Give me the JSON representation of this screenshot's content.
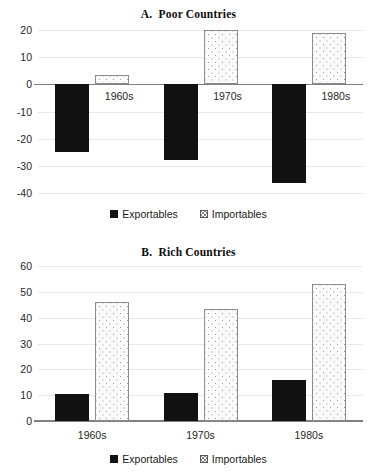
{
  "figure": {
    "panels": [
      "A",
      "B"
    ]
  },
  "legend": {
    "exportables_label": "Exportables",
    "importables_label": "Importables",
    "exportables_swatch": "filled-square-icon",
    "importables_swatch": "dotted-square-icon",
    "exportables_color": "#111111",
    "importables_color": "#fbfbfb"
  },
  "panel_a": {
    "title": "A.  Poor Countries",
    "y_ticks": [
      "20",
      "10",
      "0",
      "-10",
      "-20",
      "-30",
      "-40"
    ],
    "categories": [
      "1960s",
      "1970s",
      "1980s"
    ]
  },
  "panel_b": {
    "title": "B.  Rich Countries",
    "y_ticks": [
      "60",
      "50",
      "40",
      "30",
      "20",
      "10",
      "0"
    ],
    "categories": [
      "1960s",
      "1970s",
      "1980s"
    ]
  },
  "chart_data": [
    {
      "type": "bar",
      "title": "A.  Poor Countries",
      "xlabel": "",
      "ylabel": "",
      "categories": [
        "1960s",
        "1970s",
        "1980s"
      ],
      "series": [
        {
          "name": "Exportables",
          "values": [
            -25,
            -28,
            -36.5
          ],
          "color": "#111111"
        },
        {
          "name": "Importables",
          "values": [
            3.5,
            20,
            19
          ],
          "color": "#fbfbfb"
        }
      ],
      "ylim": [
        -40,
        20
      ],
      "yticks": [
        20,
        10,
        0,
        -10,
        -20,
        -30,
        -40
      ],
      "grid": true,
      "legend": "bottom"
    },
    {
      "type": "bar",
      "title": "B.  Rich Countries",
      "xlabel": "",
      "ylabel": "",
      "categories": [
        "1960s",
        "1970s",
        "1980s"
      ],
      "series": [
        {
          "name": "Exportables",
          "values": [
            10.5,
            11,
            16
          ],
          "color": "#111111"
        },
        {
          "name": "Importables",
          "values": [
            46,
            43.5,
            53
          ],
          "color": "#fbfbfb"
        }
      ],
      "ylim": [
        0,
        60
      ],
      "yticks": [
        60,
        50,
        40,
        30,
        20,
        10,
        0
      ],
      "grid": true,
      "legend": "bottom"
    }
  ]
}
